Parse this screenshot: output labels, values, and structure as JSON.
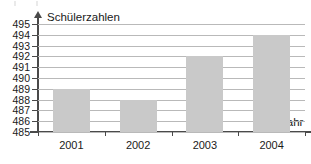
{
  "chart_data": {
    "type": "bar",
    "title": "",
    "xlabel": "Jahr",
    "ylabel": "Schülerzahlen",
    "categories": [
      "2001",
      "2002",
      "2003",
      "2004"
    ],
    "values": [
      489,
      488,
      492,
      494
    ],
    "ylim": [
      485,
      495
    ],
    "yticks": [
      485,
      486,
      487,
      488,
      489,
      490,
      491,
      492,
      493,
      494,
      495
    ],
    "ytick_labels": [
      "485",
      "486",
      "487",
      "488",
      "489",
      "490",
      "491",
      "492",
      "493",
      "494",
      "495"
    ],
    "grid": true,
    "legend": null,
    "series": [
      {
        "name": "Schülerzahlen",
        "values": [
          489,
          488,
          492,
          494
        ],
        "color": "#c9c9c9"
      }
    ],
    "colors": {
      "bar_fill": "#c9c9c9",
      "gridline": "#b9b9b9",
      "axis": "#4a4a4a",
      "text": "#1a1a1a",
      "background": "#ffffff"
    }
  }
}
